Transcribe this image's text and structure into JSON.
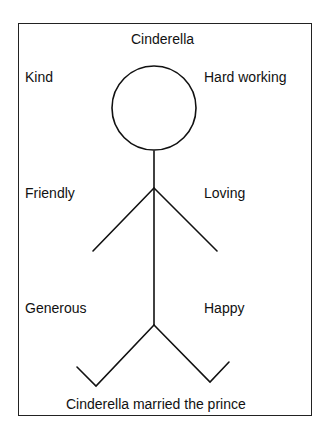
{
  "title": "Cinderella",
  "traits": {
    "top_left": "Kind",
    "top_right": "Hard working",
    "mid_left": "Friendly",
    "mid_right": "Loving",
    "bottom_left": "Generous",
    "bottom_right": "Happy"
  },
  "caption": "Cinderella married the prince",
  "figure": "stick-figure"
}
